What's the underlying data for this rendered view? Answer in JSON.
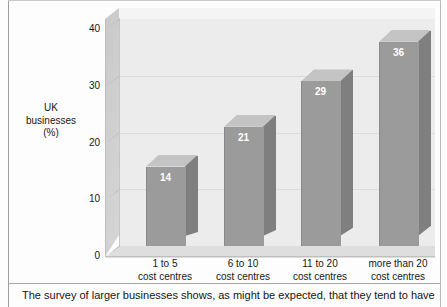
{
  "chart_data": {
    "type": "bar",
    "title": "",
    "xlabel": "",
    "ylabel": "UK businesses (%)",
    "ylabel_lines": [
      "UK",
      "businesses",
      "(%)"
    ],
    "categories": [
      "1 to 5 cost centres",
      "6 to 10 cost centres",
      "11 to 20 cost centres",
      "more than 20 cost centres"
    ],
    "category_lines": [
      [
        "1 to 5",
        "cost centres"
      ],
      [
        "6 to 10",
        "cost centres"
      ],
      [
        "11 to 20",
        "cost centres"
      ],
      [
        "more than 20",
        "cost centres"
      ]
    ],
    "values": [
      14,
      21,
      29,
      36
    ],
    "value_labels": [
      "14",
      "21",
      "29",
      "36"
    ],
    "ylim": [
      0,
      40
    ],
    "yticks": [
      40,
      30,
      20,
      10,
      0
    ],
    "ytick_labels": [
      "40",
      "30",
      "20",
      "10",
      "0"
    ],
    "grid": true,
    "grid_axis": "y",
    "legend": false,
    "style": "3d-column",
    "colors": {
      "bar_front": "#9b9b9b",
      "bar_side": "#7f7f7f",
      "bar_top": "#c4c4c4",
      "plot_background": "#ececed",
      "floor": "#dedede",
      "left_wall": "#d0d0d0",
      "gridline": "#dcdcdc",
      "value_label": "#ffffff",
      "text": "#171717"
    }
  },
  "caption": {
    "text": "The survey of larger businesses shows, as might be expected, that they tend to have"
  }
}
